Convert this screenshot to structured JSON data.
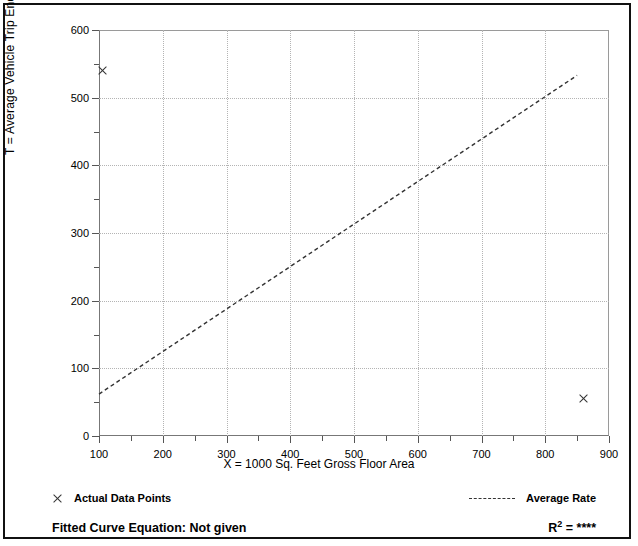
{
  "chart_data": {
    "type": "scatter",
    "title": "",
    "xlabel": "X = 1000 Sq. Feet Gross Floor Area",
    "ylabel": "T = Average Vehicle Trip Ends",
    "xlim": [
      100,
      900
    ],
    "ylim": [
      0,
      600
    ],
    "x_ticks": [
      100,
      200,
      300,
      400,
      500,
      600,
      700,
      800,
      900
    ],
    "x_tick_labels": [
      "100",
      "200",
      "300",
      "400",
      "500",
      "600",
      "700",
      "800",
      "900"
    ],
    "x_minor_step": 50,
    "y_ticks": [
      0,
      100,
      200,
      300,
      400,
      500,
      600
    ],
    "y_tick_labels": [
      "0",
      "100",
      "200",
      "300",
      "400",
      "500",
      "600"
    ],
    "y_minor_step": 50,
    "grid": "dotted-both",
    "legend_position": "below-axes",
    "series": [
      {
        "name": "Actual Data Points",
        "marker": "x",
        "points": [
          {
            "x": 105,
            "y": 540
          },
          {
            "x": 860,
            "y": 55
          }
        ]
      },
      {
        "name": "Average Rate",
        "style": "dashed-line",
        "endpoints": [
          {
            "x": 100,
            "y": 62
          },
          {
            "x": 850,
            "y": 533
          }
        ]
      }
    ],
    "annotations": {
      "fitted_curve_equation": "Fitted Curve Equation:  Not given",
      "r_squared_label": "R",
      "r_squared_exponent": "2",
      "r_squared_value": "= ****"
    }
  },
  "legend": {
    "data_points_label": "Actual Data Points",
    "average_rate_label": "Average Rate"
  },
  "colors": {
    "frame": "#111111",
    "grid": "#b4b4b4",
    "axis": "#777777",
    "marker": "#333333",
    "line": "#333333",
    "background": "#ffffff"
  }
}
